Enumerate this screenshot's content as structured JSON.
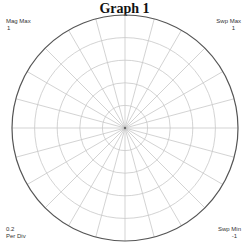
{
  "header": {
    "title": "Graph 1"
  },
  "corners": {
    "top_left": {
      "label": "Mag Max",
      "value": "1"
    },
    "top_right": {
      "label": "Swp Max",
      "value": "1"
    },
    "bottom_left": {
      "value": "0.2",
      "label": "Per Div"
    },
    "bottom_right": {
      "label": "Swp Min",
      "value": "-1"
    }
  },
  "colors": {
    "grid": "#c8c8c8",
    "outer_ring": "#555555",
    "text": "#333333"
  },
  "chart_data": {
    "type": "polar",
    "title": "Graph 1",
    "mag_max": 1,
    "per_div": 0.2,
    "rings": [
      0.2,
      0.4,
      0.6,
      0.8,
      1.0
    ],
    "radial_spoke_step_deg": 15,
    "sweep_max": 1,
    "sweep_min": -1,
    "series": [],
    "grid": true
  }
}
